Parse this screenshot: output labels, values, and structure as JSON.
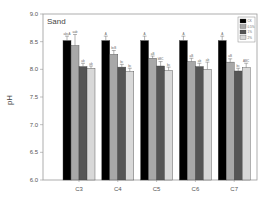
{
  "chart_data": {
    "type": "bar",
    "title": "Sand",
    "xlabel": "",
    "ylabel": "pH",
    "ylim": [
      6.0,
      9.0
    ],
    "yticks": [
      "6.0",
      "6.5",
      "7.0",
      "7.5",
      "8.0",
      "8.5",
      "9.0"
    ],
    "categories": [
      "C3",
      "C4",
      "C5",
      "C6",
      "C7"
    ],
    "grid": false,
    "legend_position": "upper right",
    "series": [
      {
        "name": "CK",
        "color": "#000000",
        "values": [
          8.52,
          8.52,
          8.52,
          8.52,
          8.52
        ],
        "errors": [
          0.08,
          0.08,
          0.08,
          0.08,
          0.08
        ],
        "labels": [
          "abcA",
          "A",
          "A",
          "A",
          "A"
        ]
      },
      {
        "name": "0.5%",
        "color": "#a8a8a8",
        "values": [
          8.43,
          8.27,
          8.2,
          8.14,
          8.13
        ],
        "errors": [
          0.2,
          0.07,
          0.04,
          0.06,
          0.06
        ],
        "labels": [
          "aab",
          "bcB",
          "aB",
          "aB",
          "aB"
        ]
      },
      {
        "name": "1%",
        "color": "#555555",
        "values": [
          8.05,
          8.04,
          8.06,
          8.05,
          7.97
        ],
        "errors": [
          0.06,
          0.05,
          0.08,
          0.06,
          0.05
        ],
        "labels": [
          "ab",
          "bc",
          "bBC",
          "ab",
          "bc"
        ]
      },
      {
        "name": "2%",
        "color": "#d8d8d8",
        "values": [
          8.02,
          7.96,
          7.98,
          8.0,
          8.03
        ],
        "errors": [
          0.04,
          0.06,
          0.06,
          0.13,
          0.08
        ],
        "labels": [
          "ab",
          "bc",
          "bc",
          "ab",
          "ABC"
        ]
      }
    ]
  }
}
